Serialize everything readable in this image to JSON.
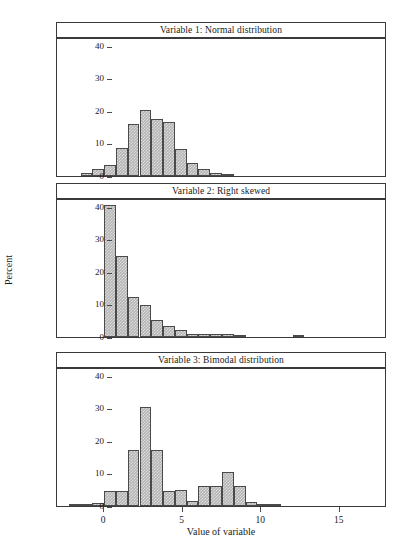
{
  "figure": {
    "xlabel": "Value of variable",
    "ylabel": "Percent"
  },
  "chart_data": [
    {
      "type": "bar",
      "title": "Variable 1: Normal distribution",
      "xlabel": "Value of variable",
      "ylabel": "Percent",
      "xlim": [
        -3.0,
        18.0
      ],
      "ylim": [
        0,
        43
      ],
      "yticks": [
        0,
        10,
        20,
        30,
        40
      ],
      "xticks": [
        0,
        5,
        10,
        15
      ],
      "bin_width": 0.75,
      "grid": false,
      "bin_left_edges": [
        -1.5,
        -0.75,
        0.0,
        0.75,
        1.5,
        2.25,
        3.0,
        3.75,
        4.5,
        5.25,
        6.0,
        6.75,
        7.5
      ],
      "values": [
        0.8,
        2.1,
        3.4,
        8.7,
        16.0,
        20.2,
        17.5,
        16.7,
        8.3,
        4.0,
        2.2,
        0.9,
        0.3
      ]
    },
    {
      "type": "bar",
      "title": "Variable 2: Right skewed",
      "xlabel": "Value of variable",
      "ylabel": "Percent",
      "xlim": [
        -3.0,
        18.0
      ],
      "ylim": [
        0,
        43
      ],
      "yticks": [
        0,
        10,
        20,
        30,
        40
      ],
      "xticks": [
        0,
        5,
        10,
        15
      ],
      "bin_width": 0.75,
      "grid": false,
      "bin_left_edges": [
        0.0,
        0.75,
        1.5,
        2.25,
        3.0,
        3.75,
        4.5,
        5.25,
        6.0,
        6.75,
        7.5,
        8.25,
        12.0
      ],
      "values": [
        40.5,
        24.8,
        12.2,
        9.7,
        5.1,
        3.4,
        2.3,
        1.0,
        1.0,
        1.0,
        1.0,
        0.4,
        0.4
      ]
    },
    {
      "type": "bar",
      "title": "Variable 3: Bimodal distribution",
      "xlabel": "Value of variable",
      "ylabel": "Percent",
      "xlim": [
        -3.0,
        18.0
      ],
      "ylim": [
        0,
        43
      ],
      "yticks": [
        0,
        10,
        20,
        30,
        40
      ],
      "xticks": [
        0,
        5,
        10,
        15
      ],
      "bin_width": 0.75,
      "grid": false,
      "bin_left_edges": [
        -2.25,
        -1.5,
        -0.75,
        0.0,
        0.75,
        1.5,
        2.25,
        3.0,
        3.75,
        4.5,
        5.25,
        6.0,
        6.75,
        7.5,
        8.25,
        9.0,
        9.75,
        10.5
      ],
      "values": [
        0.2,
        0.3,
        0.8,
        4.6,
        4.6,
        17.2,
        30.3,
        17.2,
        4.6,
        4.9,
        1.6,
        6.1,
        6.1,
        10.5,
        6.2,
        1.2,
        0.4,
        0.3
      ]
    }
  ]
}
